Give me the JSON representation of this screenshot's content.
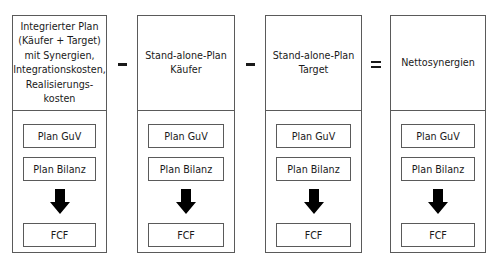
{
  "columns": [
    {
      "title": "Integrierter Plan\n(Käufer + Target)\nmit Synergien,\nIntegrationskosten,\nRealisierungs-\nkosten",
      "boxes": [
        "Plan GuV",
        "Plan Bilanz"
      ],
      "result": "FCF"
    },
    {
      "title": "Stand-alone-Plan\nKäufer",
      "boxes": [
        "Plan GuV",
        "Plan Bilanz"
      ],
      "result": "FCF"
    },
    {
      "title": "Stand-alone-Plan\nTarget",
      "boxes": [
        "Plan GuV",
        "Plan Bilanz"
      ],
      "result": "FCF"
    },
    {
      "title": "Nettosynergien",
      "boxes": [
        "Plan GuV",
        "Plan Bilanz"
      ],
      "result": "FCF"
    }
  ],
  "operators": [
    "−",
    "−",
    "="
  ],
  "icons": {
    "arrow": "down-arrow-icon",
    "minus": "minus-icon",
    "equals": "equals-icon"
  },
  "colors": {
    "border": "#5a5a5a",
    "arrow": "#000000",
    "background": "#ffffff"
  }
}
